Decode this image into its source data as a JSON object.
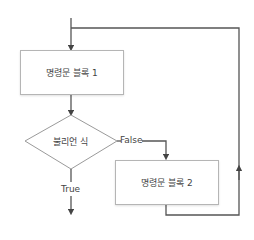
{
  "diagram": {
    "type": "flowchart-while-loop",
    "nodes": {
      "block1": {
        "label": "명령문 블록 1"
      },
      "condition": {
        "label": "불리언 식"
      },
      "block2": {
        "label": "명령문 블록 2"
      }
    },
    "edges": {
      "false_label": "False",
      "true_label": "True"
    },
    "colors": {
      "line": "#555555",
      "border": "#b5b5b5"
    }
  }
}
